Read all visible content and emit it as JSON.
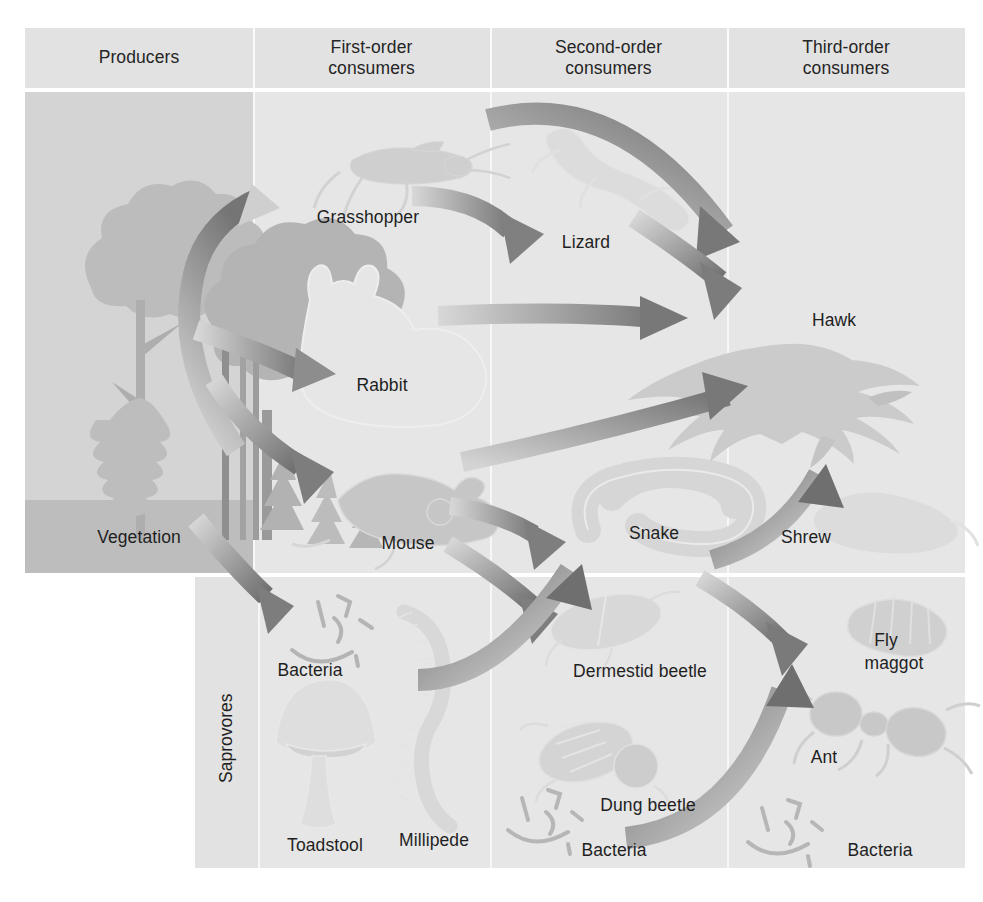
{
  "diagram": {
    "type": "food-web",
    "columns": [
      {
        "id": "producers",
        "label": "Producers",
        "x_range": [
          25,
          253
        ]
      },
      {
        "id": "first-order",
        "label": "First-order consumers",
        "x_range": [
          253,
          490
        ]
      },
      {
        "id": "second-order",
        "label": "Second-order consumers",
        "x_range": [
          490,
          727
        ]
      },
      {
        "id": "third-order",
        "label": "Third-order consumers",
        "x_range": [
          727,
          965
        ]
      }
    ],
    "header": {
      "producers": "Producers",
      "first_order_line1": "First-order",
      "first_order_line2": "consumers",
      "second_order_line1": "Second-order",
      "second_order_line2": "consumers",
      "third_order_line1": "Third-order",
      "third_order_line2": "consumers"
    },
    "row_label_saprovores": "Saprovores",
    "organisms": [
      {
        "id": "vegetation",
        "label": "Vegetation",
        "column": "producers",
        "row": "main"
      },
      {
        "id": "grasshopper",
        "label": "Grasshopper",
        "column": "first-order",
        "row": "main"
      },
      {
        "id": "rabbit",
        "label": "Rabbit",
        "column": "first-order",
        "row": "main"
      },
      {
        "id": "mouse",
        "label": "Mouse",
        "column": "first-order",
        "row": "main"
      },
      {
        "id": "lizard",
        "label": "Lizard",
        "column": "second-order",
        "row": "main"
      },
      {
        "id": "snake",
        "label": "Snake",
        "column": "second-order",
        "row": "main"
      },
      {
        "id": "hawk",
        "label": "Hawk",
        "column": "third-order",
        "row": "main"
      },
      {
        "id": "shrew",
        "label": "Shrew",
        "column": "third-order",
        "row": "main"
      },
      {
        "id": "bacteria-1",
        "label": "Bacteria",
        "column": "first-order",
        "row": "saprovores"
      },
      {
        "id": "toadstool",
        "label": "Toadstool",
        "column": "first-order",
        "row": "saprovores"
      },
      {
        "id": "millipede",
        "label": "Millipede",
        "column": "first-order",
        "row": "saprovores"
      },
      {
        "id": "dermestid-beetle",
        "label": "Dermestid beetle",
        "column": "second-order",
        "row": "saprovores"
      },
      {
        "id": "dung-beetle",
        "label": "Dung beetle",
        "column": "second-order",
        "row": "saprovores"
      },
      {
        "id": "bacteria-2",
        "label": "Bacteria",
        "column": "second-order",
        "row": "saprovores"
      },
      {
        "id": "fly-maggot-l1",
        "label": "Fly",
        "column": "third-order",
        "row": "saprovores"
      },
      {
        "id": "fly-maggot-l2",
        "label": "maggot",
        "column": "third-order",
        "row": "saprovores"
      },
      {
        "id": "ant",
        "label": "Ant",
        "column": "third-order",
        "row": "saprovores"
      },
      {
        "id": "bacteria-3",
        "label": "Bacteria",
        "column": "third-order",
        "row": "saprovores"
      }
    ],
    "flows": [
      {
        "from": "vegetation",
        "to": "grasshopper"
      },
      {
        "from": "vegetation",
        "to": "rabbit"
      },
      {
        "from": "vegetation",
        "to": "mouse"
      },
      {
        "from": "vegetation",
        "to": "bacteria-1"
      },
      {
        "from": "grasshopper",
        "to": "lizard"
      },
      {
        "from": "grasshopper",
        "to": "hawk"
      },
      {
        "from": "rabbit",
        "to": "hawk"
      },
      {
        "from": "lizard",
        "to": "hawk"
      },
      {
        "from": "mouse",
        "to": "snake"
      },
      {
        "from": "mouse",
        "to": "hawk"
      },
      {
        "from": "mouse",
        "to": "dermestid-beetle"
      },
      {
        "from": "snake",
        "to": "hawk"
      },
      {
        "from": "snake",
        "to": "shrew"
      },
      {
        "from": "millipede",
        "to": "snake"
      },
      {
        "from": "dung-beetle",
        "to": "shrew"
      }
    ],
    "colors": {
      "page_background": "#ffffff",
      "header_band": "#e2e2e2",
      "main_band": "#e6e6e6",
      "producers_panel": "#d4d4d4",
      "ground": "#bdbdbd",
      "arrow_dark": "#7c7c7c",
      "arrow_light": "#d2d2d2",
      "text": "#1f1f1f",
      "silhouette": "#c9c9c9"
    }
  }
}
